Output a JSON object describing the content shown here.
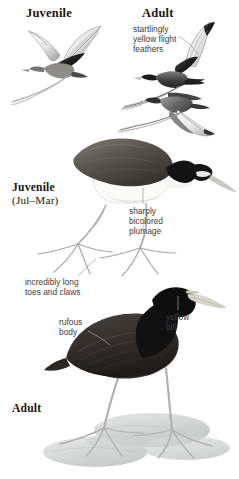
{
  "plate": {
    "title": "Northern Jacana plate",
    "background_color": "#ffffff",
    "width": 239,
    "height": 479
  },
  "labels": {
    "juvenile_flight": "Juvenile",
    "adult_flight": "Adult",
    "juvenile_standing": "Juvenile",
    "juvenile_standing_months": "(Jul–Mar)",
    "adult_standing": "Adult"
  },
  "annotations": [
    {
      "id": "flight-feathers",
      "text": "startlingly\nyellow flight\nfeathers",
      "lines": [
        "startlingly",
        "yellow flight",
        "feathers"
      ],
      "leader": "diagonal-right-down"
    },
    {
      "id": "bicolored-plumage",
      "text": "sharply\nbicolored\nplumage",
      "lines": [
        "sharply",
        "bicolored",
        "plumage"
      ],
      "leader": "vertical-up"
    },
    {
      "id": "long-toes",
      "text": "incredibly long\ntoes and claws",
      "lines": [
        "incredibly long",
        "toes and claws"
      ],
      "leader": "diagonal-right-up"
    },
    {
      "id": "rufous-body",
      "text": "rufous\nbody",
      "lines": [
        "rufous",
        "body"
      ],
      "leader": "diagonal-right-down"
    },
    {
      "id": "yellow-bill",
      "text": "yellow\nbill",
      "lines": [
        "yellow",
        "bill"
      ],
      "leader": "vertical-up"
    }
  ],
  "figures": [
    {
      "id": "juvenile-in-flight",
      "pose": "flying",
      "age": "juvenile",
      "notes": "pale body, white-and-dark wings raised, very long trailing toes"
    },
    {
      "id": "adult-in-flight-upper",
      "pose": "flying",
      "age": "adult",
      "notes": "blackish body, pale flight feathers, long trailing toes"
    },
    {
      "id": "adult-in-flight-lower",
      "pose": "flying",
      "age": "adult",
      "notes": "grey-toned second flight figure below, wings down"
    },
    {
      "id": "juvenile-standing",
      "pose": "standing",
      "age": "juvenile",
      "notes": "dark grey-brown upperparts, white underparts, dark eyestripe, very long toes"
    },
    {
      "id": "adult-standing",
      "pose": "standing",
      "age": "adult",
      "notes": "black head and neck, dark rufous body, yellow bill, long legs on lily pads"
    }
  ],
  "palette": {
    "background": "#ffffff",
    "ink_dark": "#1a1512",
    "bird_black": "#141414",
    "bird_rufous": "#3d3733",
    "bird_grey": "#6e6e6e",
    "bird_pale": "#d8d8d8",
    "leader_line": "#9a9a9a",
    "lilypad": "#c9cdcb",
    "annotation_text": "#3b3b3b",
    "label_text": "#1a1512"
  }
}
